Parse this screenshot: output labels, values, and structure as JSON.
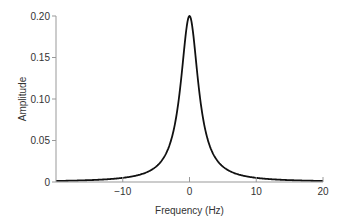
{
  "chart_data": {
    "type": "line",
    "title": "",
    "xlabel": "Frequency (Hz)",
    "ylabel": "Amplitude",
    "xlim": [
      -20,
      20
    ],
    "ylim": [
      0,
      0.2
    ],
    "xticks": [
      -20,
      -10,
      0,
      10,
      20
    ],
    "xtick_labels": [
      "",
      "−10",
      "0",
      "10",
      "20"
    ],
    "yticks": [
      0,
      0.05,
      0.1,
      0.15,
      0.2
    ],
    "ytick_labels": [
      "0",
      "0.05",
      "0.10",
      "0.15",
      "0.20"
    ],
    "grid": false,
    "legend": null,
    "series": [
      {
        "name": "Lorentzian spectrum",
        "function": "0.2 * 1.6^2 / (f^2 + 1.6^2)",
        "x": [
          -20,
          -15,
          -10,
          -7,
          -5,
          -4,
          -3,
          -2,
          -1.5,
          -1,
          -0.5,
          0,
          0.5,
          1,
          1.5,
          2,
          3,
          4,
          5,
          7,
          10,
          15,
          20
        ],
        "y": [
          0.0013,
          0.0023,
          0.005,
          0.0099,
          0.0186,
          0.0275,
          0.0443,
          0.078,
          0.1066,
          0.1438,
          0.1822,
          0.2,
          0.1822,
          0.1438,
          0.1066,
          0.078,
          0.0443,
          0.0275,
          0.0186,
          0.0099,
          0.005,
          0.0023,
          0.0013
        ]
      }
    ],
    "line_color": "#111111"
  }
}
